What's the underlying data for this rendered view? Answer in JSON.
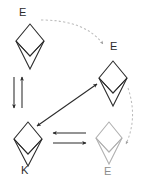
{
  "diagram": {
    "type": "state-transition-diagram",
    "background_color": "#ffffff",
    "stroke_color_dark": "#2b2b2b",
    "stroke_color_light": "#b0b0b0",
    "dashed_color": "#b8b8b8",
    "nodes": [
      {
        "id": "node-top-left",
        "icon": "ethereum-diamond-icon",
        "label": "E",
        "label_position": "above",
        "shade": "dark",
        "cx": 30,
        "cy": 45
      },
      {
        "id": "node-right",
        "icon": "ethereum-diamond-icon",
        "label": "E",
        "label_position": "above-left",
        "shade": "dark",
        "cx": 113,
        "cy": 82
      },
      {
        "id": "node-bottom-left",
        "icon": "ethereum-diamond-icon",
        "label": "K",
        "label_position": "below",
        "shade": "dark",
        "cx": 28,
        "cy": 143
      },
      {
        "id": "node-bottom-right",
        "icon": "ethereum-diamond-icon",
        "label": "E",
        "label_position": "below",
        "shade": "light",
        "cx": 109,
        "cy": 143
      }
    ],
    "edges": [
      {
        "id": "edge-dashed-top",
        "style": "dashed",
        "arrow": "end",
        "from": "node-top-left",
        "to": "node-right",
        "color": "#b8b8b8"
      },
      {
        "id": "edge-dashed-right",
        "style": "dashed",
        "arrow": "end",
        "from": "node-right",
        "to": "node-bottom-right",
        "color": "#b8b8b8"
      },
      {
        "id": "edge-vertical-down",
        "style": "solid",
        "arrow": "end",
        "direction": "down",
        "from": "node-top-left",
        "to": "node-bottom-left",
        "color": "#2b2b2b"
      },
      {
        "id": "edge-vertical-up",
        "style": "solid",
        "arrow": "end",
        "direction": "up",
        "from": "node-bottom-left",
        "to": "node-top-left",
        "color": "#2b2b2b"
      },
      {
        "id": "edge-diagonal",
        "style": "solid",
        "arrow": "both",
        "from": "node-bottom-left",
        "to": "node-right",
        "color": "#2b2b2b"
      },
      {
        "id": "edge-horizontal-left",
        "style": "solid",
        "arrow": "end",
        "direction": "left",
        "from": "node-bottom-right",
        "to": "node-bottom-left",
        "color": "#2b2b2b"
      },
      {
        "id": "edge-horizontal-right",
        "style": "solid",
        "arrow": "end",
        "direction": "right",
        "from": "node-bottom-left",
        "to": "node-bottom-right",
        "color": "#2b2b2b"
      }
    ],
    "labels": {
      "e_top": "E",
      "e_right": "E",
      "k_bottom": "K",
      "e_bottom": "E"
    }
  }
}
